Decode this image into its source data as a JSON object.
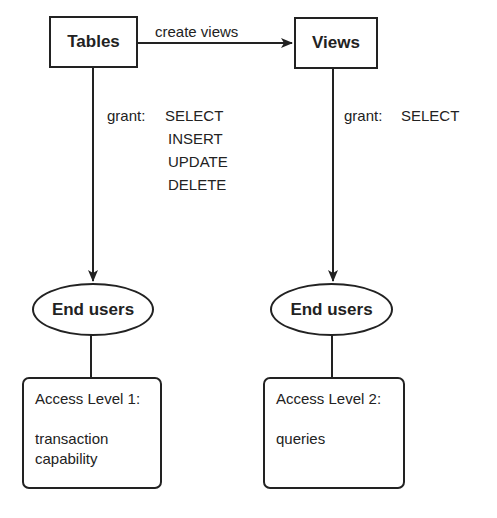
{
  "diagram": {
    "nodes": {
      "tables": {
        "label": "Tables",
        "shape": "rectangle"
      },
      "views": {
        "label": "Views",
        "shape": "rectangle"
      },
      "end_users_left": {
        "label": "End users",
        "shape": "ellipse"
      },
      "end_users_right": {
        "label": "End users",
        "shape": "ellipse"
      },
      "access_level_1": {
        "title": "Access Level 1:",
        "lines": [
          "transaction",
          "capability"
        ],
        "shape": "rounded-rectangle"
      },
      "access_level_2": {
        "title": "Access Level 2:",
        "lines": [
          "queries"
        ],
        "shape": "rounded-rectangle"
      }
    },
    "edges": {
      "tables_to_views": {
        "label": "create views"
      },
      "tables_to_users": {
        "keyword": "grant:",
        "permissions": [
          "SELECT",
          "INSERT",
          "UPDATE",
          "DELETE"
        ]
      },
      "views_to_users": {
        "keyword": "grant:",
        "permissions": [
          "SELECT"
        ]
      }
    },
    "colors": {
      "stroke": "#222222",
      "background": "#ffffff"
    }
  }
}
